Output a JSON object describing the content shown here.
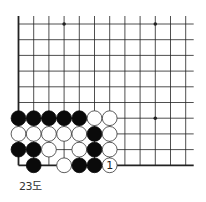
{
  "diagram": {
    "caption": "23도",
    "grid": {
      "cols": 12,
      "rows": 10,
      "origin_x": 18.5,
      "origin_y": 24,
      "spacing_x": 15.2,
      "spacing_y": 15.7,
      "extend_right": 8,
      "extend_top": 8,
      "edges": {
        "left": true,
        "bottom": true,
        "top": false,
        "right": false
      },
      "line_color": "#222222"
    },
    "star_points": [
      {
        "col": 3,
        "row": 0
      },
      {
        "col": 9,
        "row": 0
      },
      {
        "col": 9,
        "row": 6
      }
    ],
    "stones": [
      {
        "col": 0,
        "row": 6,
        "color": "black"
      },
      {
        "col": 1,
        "row": 6,
        "color": "black"
      },
      {
        "col": 2,
        "row": 6,
        "color": "black"
      },
      {
        "col": 3,
        "row": 6,
        "color": "black"
      },
      {
        "col": 4,
        "row": 6,
        "color": "black"
      },
      {
        "col": 5,
        "row": 6,
        "color": "white"
      },
      {
        "col": 6,
        "row": 6,
        "color": "white"
      },
      {
        "col": 0,
        "row": 7,
        "color": "white"
      },
      {
        "col": 1,
        "row": 7,
        "color": "white"
      },
      {
        "col": 2,
        "row": 7,
        "color": "white"
      },
      {
        "col": 3,
        "row": 7,
        "color": "white"
      },
      {
        "col": 4,
        "row": 7,
        "color": "white"
      },
      {
        "col": 5,
        "row": 7,
        "color": "black"
      },
      {
        "col": 6,
        "row": 7,
        "color": "white"
      },
      {
        "col": 0,
        "row": 8,
        "color": "black"
      },
      {
        "col": 1,
        "row": 8,
        "color": "black"
      },
      {
        "col": 2,
        "row": 8,
        "color": "white"
      },
      {
        "col": 4,
        "row": 8,
        "color": "white"
      },
      {
        "col": 5,
        "row": 8,
        "color": "black"
      },
      {
        "col": 6,
        "row": 8,
        "color": "white"
      },
      {
        "col": 1,
        "row": 9,
        "color": "black"
      },
      {
        "col": 3,
        "row": 9,
        "color": "white"
      },
      {
        "col": 4,
        "row": 9,
        "color": "black"
      },
      {
        "col": 5,
        "row": 9,
        "color": "black"
      },
      {
        "col": 6,
        "row": 9,
        "color": "white",
        "label": "1"
      }
    ],
    "colors": {
      "black_stone": "#0a0a0a",
      "white_stone": "#ffffff",
      "stone_outline": "#333333",
      "label": "#222222"
    }
  }
}
